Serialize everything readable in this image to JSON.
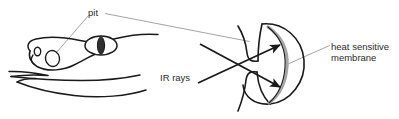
{
  "figure": {
    "background": "#ffffff",
    "ink_color": "#1a1a1a",
    "leader_color": "#8c8c8c",
    "membrane_color": "#a6a6a6",
    "text_color": "#2b2b2b",
    "width": 399,
    "height": 119
  },
  "labels": {
    "pit": "pit",
    "ir_rays": "IR rays",
    "membrane_line1": "heat sensitive",
    "membrane_line2": "membrane"
  },
  "parts": {
    "snake_head": "snake-head-outline",
    "eye": "snake-eye",
    "pupil": "vertical-slit-pupil",
    "nostril": "nostril",
    "pit_opening": "facial-pit-opening",
    "jaw": "lower-jaw-lines",
    "pit_organ": "pit-organ-chamber",
    "membrane": "heat-sensitive-membrane-arc",
    "ray_upper": "ir-ray-arrow-upper",
    "ray_lower": "ir-ray-arrow-lower"
  }
}
